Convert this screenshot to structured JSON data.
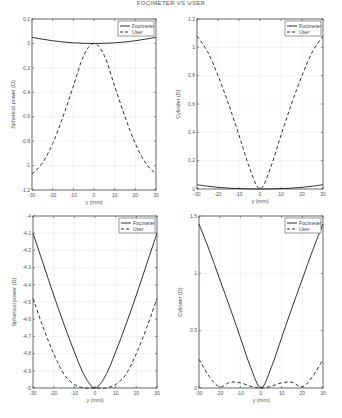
{
  "figure": {
    "title": "FOCIMETER VS USER"
  },
  "chart_data": [
    {
      "type": "line",
      "panel": "top-left",
      "title": "",
      "xlabel": "y (mm)",
      "ylabel": "Spherical power (D)",
      "xlim": [
        -30,
        30
      ],
      "ylim": [
        -1.2,
        0.2
      ],
      "xticks": [
        -30,
        -20,
        -10,
        0,
        10,
        20,
        30
      ],
      "yticks": [
        0.2,
        0,
        -0.2,
        -0.4,
        -0.6,
        -0.8,
        -1,
        -1.2
      ],
      "ytick_labels": [
        "0.2",
        "0",
        "-0.2",
        "-0.4",
        "-0.6",
        "-0.8",
        "-1",
        "-1.2"
      ],
      "grid": true,
      "legend": {
        "position": "upper right",
        "entries": [
          "Focimeter",
          "User"
        ]
      },
      "x": [
        -30,
        -25,
        -20,
        -15,
        -10,
        -5,
        0,
        5,
        10,
        15,
        20,
        25,
        30
      ],
      "series": [
        {
          "name": "Focimeter",
          "style": "solid",
          "values": [
            0.05,
            0.035,
            0.022,
            0.012,
            0.005,
            0.001,
            0,
            0.001,
            0.005,
            0.012,
            0.022,
            0.035,
            0.05
          ]
        },
        {
          "name": "User",
          "style": "dashed",
          "values": [
            -1.07,
            -0.98,
            -0.82,
            -0.6,
            -0.35,
            -0.1,
            0,
            -0.1,
            -0.35,
            -0.6,
            -0.82,
            -0.98,
            -1.07
          ]
        }
      ]
    },
    {
      "type": "line",
      "panel": "top-right",
      "title": "",
      "xlabel": "y (mm)",
      "ylabel": "Cylinder (D)",
      "xlim": [
        -30,
        30
      ],
      "ylim": [
        0,
        1.2
      ],
      "xticks": [
        -30,
        -20,
        -10,
        0,
        10,
        20,
        30
      ],
      "yticks": [
        0,
        0.2,
        0.4,
        0.6,
        0.8,
        1,
        1.2
      ],
      "ytick_labels": [
        "0",
        "0.2",
        "0.4",
        "0.6",
        "0.8",
        "1",
        "1.2"
      ],
      "grid": true,
      "legend": {
        "position": "upper right",
        "entries": [
          "Focimeter",
          "User"
        ]
      },
      "x": [
        -30,
        -25,
        -20,
        -15,
        -10,
        -5,
        0,
        5,
        10,
        15,
        20,
        25,
        30
      ],
      "series": [
        {
          "name": "Focimeter",
          "style": "solid",
          "values": [
            0.03,
            0.02,
            0.012,
            0.006,
            0.003,
            0.001,
            0,
            0.001,
            0.003,
            0.006,
            0.012,
            0.02,
            0.03
          ]
        },
        {
          "name": "User",
          "style": "dashed",
          "values": [
            1.08,
            0.97,
            0.8,
            0.6,
            0.38,
            0.15,
            0,
            0.15,
            0.38,
            0.6,
            0.8,
            0.97,
            1.08
          ]
        }
      ]
    },
    {
      "type": "line",
      "panel": "bottom-left",
      "title": "",
      "xlabel": "y (mm)",
      "ylabel": "Spherical power (D)",
      "xlim": [
        -30,
        30
      ],
      "ylim": [
        -5,
        -4
      ],
      "xticks": [
        -30,
        -20,
        -10,
        0,
        10,
        20,
        30
      ],
      "yticks": [
        -4,
        -4.1,
        -4.2,
        -4.3,
        -4.4,
        -4.5,
        -4.6,
        -4.7,
        -4.8,
        -4.9,
        -5
      ],
      "ytick_labels": [
        "-4",
        "-4.1",
        "-4.2",
        "-4.3",
        "-4.4",
        "-4.5",
        "-4.6",
        "-4.7",
        "-4.8",
        "-4.9",
        "-5"
      ],
      "grid": true,
      "legend": {
        "position": "upper right",
        "entries": [
          "Focimeter",
          "User"
        ]
      },
      "x": [
        -30,
        -25,
        -20,
        -15,
        -10,
        -5,
        0,
        5,
        10,
        15,
        20,
        25,
        30
      ],
      "series": [
        {
          "name": "Focimeter",
          "style": "solid",
          "values": [
            -4.1,
            -4.28,
            -4.46,
            -4.63,
            -4.79,
            -4.93,
            -5,
            -4.93,
            -4.79,
            -4.63,
            -4.46,
            -4.28,
            -4.1
          ]
        },
        {
          "name": "User",
          "style": "dashed",
          "values": [
            -4.48,
            -4.65,
            -4.8,
            -4.92,
            -4.98,
            -5,
            -5,
            -5,
            -4.98,
            -4.92,
            -4.8,
            -4.65,
            -4.48
          ]
        }
      ]
    },
    {
      "type": "line",
      "panel": "bottom-right",
      "title": "",
      "xlabel": "y (mm)",
      "ylabel": "Cylinder (D)",
      "xlim": [
        -30,
        30
      ],
      "ylim": [
        0,
        1.5
      ],
      "xticks": [
        -30,
        -20,
        -10,
        0,
        10,
        20,
        30
      ],
      "yticks": [
        0,
        0.5,
        1,
        1.5
      ],
      "ytick_labels": [
        "0",
        "0.5",
        "1",
        "1.5"
      ],
      "grid": true,
      "legend": {
        "position": "upper right",
        "entries": [
          "Focimeter",
          "User"
        ]
      },
      "x": [
        -30,
        -25,
        -20,
        -15,
        -10,
        -5,
        0,
        5,
        10,
        15,
        20,
        25,
        30
      ],
      "series": [
        {
          "name": "Focimeter",
          "style": "solid",
          "values": [
            1.43,
            1.2,
            0.95,
            0.7,
            0.44,
            0.18,
            0,
            0.18,
            0.44,
            0.7,
            0.95,
            1.2,
            1.43
          ]
        },
        {
          "name": "User",
          "style": "dashed",
          "values": [
            0.25,
            0.1,
            0.01,
            0.05,
            0.045,
            0.015,
            0,
            0.015,
            0.045,
            0.05,
            0.01,
            0.1,
            0.25
          ]
        }
      ]
    }
  ],
  "panels_layout": [
    {
      "left": 32,
      "top": 19,
      "right": 156,
      "bottom": 190
    },
    {
      "left": 197,
      "top": 19,
      "right": 323,
      "bottom": 189
    },
    {
      "left": 33,
      "top": 216,
      "right": 157,
      "bottom": 388
    },
    {
      "left": 199,
      "top": 216,
      "right": 323,
      "bottom": 388
    }
  ],
  "colors": {
    "line": "#1a1a1a",
    "axis": "#333333",
    "grid": "#e6e6e6",
    "text": "#555555"
  }
}
